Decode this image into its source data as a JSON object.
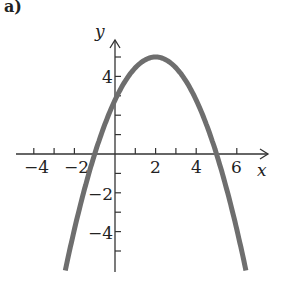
{
  "panel_label": "a)",
  "chart_data": {
    "type": "line",
    "title": "",
    "xlabel": "x",
    "ylabel": "y",
    "xlim": [
      -4.5,
      7.5
    ],
    "ylim": [
      -6,
      6
    ],
    "grid": false,
    "x_tick_labels": [
      "−4",
      "−2",
      "2",
      "4",
      "6"
    ],
    "x_ticks": [
      -4,
      -3,
      -2,
      -1,
      1,
      2,
      3,
      4,
      5,
      6
    ],
    "y_tick_labels": [
      "4",
      "−2",
      "−4"
    ],
    "y_ticks": [
      -5,
      -4,
      -3,
      -2,
      -1,
      1,
      2,
      3,
      4,
      5
    ],
    "series": [
      {
        "name": "parabola",
        "equation": "y = -5/9 (x - 2)^2 + 5",
        "vertex": [
          2,
          5
        ],
        "x_intercepts": [
          -1,
          5
        ],
        "y_intercept": 2.8,
        "x": [
          -2.5,
          -2,
          -1,
          0,
          1,
          2,
          3,
          4,
          5,
          6,
          6.5
        ],
        "y": [
          -6.25,
          -3.89,
          0,
          2.78,
          4.44,
          5,
          4.44,
          2.78,
          0,
          -3.89,
          -6.25
        ],
        "color": "#6e6e6e"
      }
    ]
  }
}
